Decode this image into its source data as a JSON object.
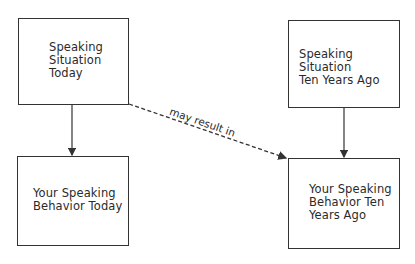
{
  "nodes": [
    {
      "id": "situation_today",
      "label": "Speaking\nSituation\nToday"
    },
    {
      "id": "situation_ten_years_ago",
      "label": "Speaking Situation\nTen Years Ago"
    },
    {
      "id": "behavior_today",
      "label": "Your Speaking\nBehavior Today"
    },
    {
      "id": "behavior_ten_years_ago",
      "label": "Your Speaking\nBehavior Ten\nYears Ago"
    }
  ],
  "edges": [
    {
      "from": "situation_today",
      "to": "behavior_today",
      "style": "solid",
      "label": ""
    },
    {
      "from": "situation_ten_years_ago",
      "to": "behavior_ten_years_ago",
      "style": "solid",
      "label": ""
    },
    {
      "from": "situation_today",
      "to": "behavior_ten_years_ago",
      "style": "dashed",
      "label": "may result in"
    }
  ],
  "colors": {
    "line": "#333333",
    "text": "#2a2a2a",
    "background": "#ffffff"
  }
}
